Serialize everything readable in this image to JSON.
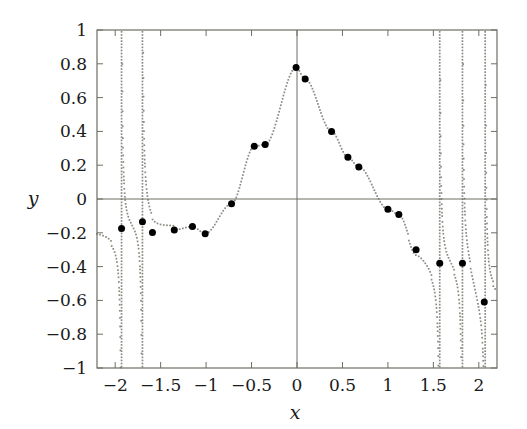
{
  "chart_data": {
    "type": "scatter",
    "title": "",
    "subtitle": "",
    "xlabel": "x",
    "ylabel": "y",
    "xlim": [
      -2.2,
      2.2
    ],
    "ylim": [
      -1,
      1
    ],
    "grid": false,
    "legend": null,
    "x_ticks": [
      -2,
      -1.5,
      -1,
      -0.5,
      0,
      0.5,
      1,
      1.5,
      2
    ],
    "x_tick_labels": [
      "−2",
      "−1.5",
      "−1",
      "−0.5",
      "0",
      "0.5",
      "1",
      "1.5",
      "2"
    ],
    "y_ticks": [
      -1,
      -0.8,
      -0.6,
      -0.4,
      -0.2,
      0,
      0.2,
      0.4,
      0.6,
      0.8,
      1
    ],
    "y_tick_labels": [
      "−1",
      "−0.8",
      "−0.6",
      "−0.4",
      "−0.2",
      "0",
      "0.2",
      "0.4",
      "0.6",
      "0.8",
      "1"
    ],
    "series": [
      {
        "name": "data-points",
        "style": "markers",
        "marker": "filled-circle",
        "marker_color": "#000000",
        "marker_size": 7,
        "points": [
          {
            "x": -1.93,
            "y": -0.175
          },
          {
            "x": -1.7,
            "y": -0.135
          },
          {
            "x": -1.59,
            "y": -0.198
          },
          {
            "x": -1.35,
            "y": -0.183
          },
          {
            "x": -1.15,
            "y": -0.163
          },
          {
            "x": -1.01,
            "y": -0.205
          },
          {
            "x": -0.72,
            "y": -0.028
          },
          {
            "x": -0.47,
            "y": 0.312
          },
          {
            "x": -0.35,
            "y": 0.322
          },
          {
            "x": -0.01,
            "y": 0.778
          },
          {
            "x": 0.09,
            "y": 0.71
          },
          {
            "x": 0.38,
            "y": 0.4
          },
          {
            "x": 0.56,
            "y": 0.247
          },
          {
            "x": 0.68,
            "y": 0.19
          },
          {
            "x": 1.0,
            "y": -0.06
          },
          {
            "x": 1.12,
            "y": -0.092
          },
          {
            "x": 1.31,
            "y": -0.3
          },
          {
            "x": 1.57,
            "y": -0.38
          },
          {
            "x": 1.82,
            "y": -0.38
          },
          {
            "x": 2.06,
            "y": -0.61
          }
        ]
      },
      {
        "name": "fitted-curve",
        "style": "dotted-line",
        "line_color": "#8a8a82",
        "asymptotes": [
          -1.93,
          -1.7,
          1.57,
          1.82,
          2.07
        ]
      }
    ],
    "axis_lines": {
      "x_axis_at_y": 0,
      "y_axis_at_x": 0,
      "color": "#6e6e64"
    },
    "frame_color": "#6e6e64"
  },
  "figure": {
    "background_color": "#ffffff",
    "dotted_curve_color": "#8a8a82",
    "marker_color": "#000000"
  }
}
